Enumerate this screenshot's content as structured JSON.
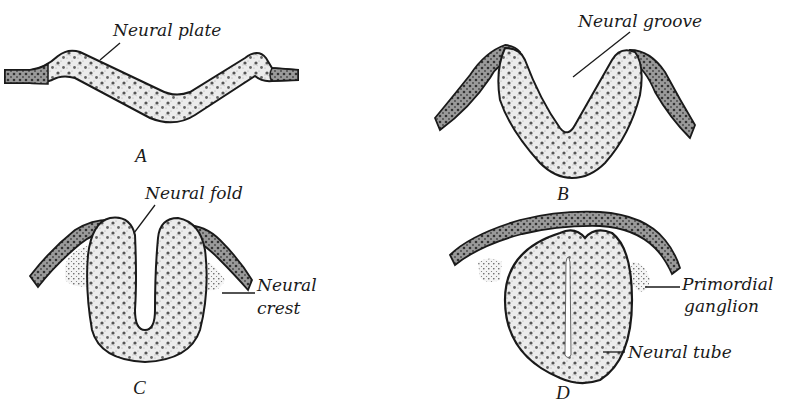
{
  "figure": {
    "colors": {
      "ink": "#1a1a1a",
      "tissue_fill": "#ececec",
      "ectoderm_fill": "#9a9a9a",
      "background": "#ffffff"
    },
    "panels": [
      {
        "id": "A",
        "letter": "A",
        "stage": "neural-plate",
        "labels": [
          {
            "text": "Neural plate",
            "target": "thickened plate of ectoderm"
          }
        ]
      },
      {
        "id": "B",
        "letter": "B",
        "stage": "neural-groove",
        "labels": [
          {
            "text": "Neural groove",
            "target": "central depression between rising folds"
          }
        ]
      },
      {
        "id": "C",
        "letter": "C",
        "stage": "neural-fold",
        "labels": [
          {
            "text": "Neural fold",
            "target": "elevated lateral edge of groove"
          },
          {
            "text": "Neural",
            "text2": "crest",
            "target": "cells at junction of fold and ectoderm"
          }
        ]
      },
      {
        "id": "D",
        "letter": "D",
        "stage": "neural-tube",
        "labels": [
          {
            "text": "Primordial",
            "text2": "ganglion",
            "target": "detached neural crest cluster"
          },
          {
            "text": "Neural tube",
            "target": "closed tube beneath ectoderm"
          }
        ]
      }
    ]
  }
}
